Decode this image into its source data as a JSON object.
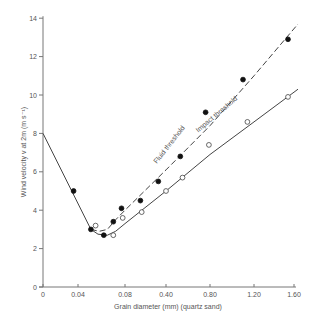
{
  "chart_data": {
    "type": "scatter",
    "title": "",
    "xlabel": "Grain diameter (mm) (quartz sand)",
    "ylabel": "Wind velocity v at 2m (m s⁻¹)",
    "x_ticks": [
      "0",
      "0.04",
      "0.08",
      "0.40",
      "0.80",
      "1.20",
      "1.60"
    ],
    "x_tick_values": [
      0,
      0.04,
      0.08,
      0.4,
      0.8,
      1.2,
      1.6
    ],
    "y_ticks": [
      "0",
      "2",
      "4",
      "6",
      "8",
      "10",
      "12",
      "14"
    ],
    "y_tick_values": [
      0,
      2,
      4,
      6,
      8,
      10,
      12,
      14
    ],
    "ylim": [
      0,
      14
    ],
    "xlim": [
      0,
      1.6
    ],
    "grid": false,
    "legend": "none (curves labeled inline)",
    "series": [
      {
        "name": "Fluid threshold",
        "marker": "filled-circle",
        "line": "dashed",
        "points": [
          {
            "x": 0.035,
            "y": 5.0
          },
          {
            "x": 0.051,
            "y": 3.0
          },
          {
            "x": 0.062,
            "y": 2.7
          },
          {
            "x": 0.07,
            "y": 3.4
          },
          {
            "x": 0.077,
            "y": 4.1
          },
          {
            "x": 0.2,
            "y": 4.5
          },
          {
            "x": 0.34,
            "y": 5.5
          },
          {
            "x": 0.53,
            "y": 6.8
          },
          {
            "x": 0.76,
            "y": 9.1
          },
          {
            "x": 1.1,
            "y": 10.8
          },
          {
            "x": 1.54,
            "y": 12.9
          }
        ],
        "curve": [
          {
            "x": 0.051,
            "y": 3.0
          },
          {
            "x": 0.058,
            "y": 2.9
          },
          {
            "x": 0.065,
            "y": 3.0
          },
          {
            "x": 0.072,
            "y": 3.5
          },
          {
            "x": 0.08,
            "y": 4.0
          },
          {
            "x": 0.4,
            "y": 6.1
          },
          {
            "x": 0.8,
            "y": 8.4
          },
          {
            "x": 1.2,
            "y": 11.0
          },
          {
            "x": 1.64,
            "y": 13.7
          }
        ]
      },
      {
        "name": "Impact threshold",
        "marker": "open-circle",
        "line": "solid",
        "points": [
          {
            "x": 0.055,
            "y": 3.2
          },
          {
            "x": 0.07,
            "y": 2.7
          },
          {
            "x": 0.078,
            "y": 3.6
          },
          {
            "x": 0.21,
            "y": 3.9
          },
          {
            "x": 0.4,
            "y": 5.0
          },
          {
            "x": 0.55,
            "y": 5.7
          },
          {
            "x": 0.79,
            "y": 7.4
          },
          {
            "x": 1.14,
            "y": 8.6
          },
          {
            "x": 1.54,
            "y": 9.9
          }
        ],
        "curve": [
          {
            "x": 0.051,
            "y": 3.0
          },
          {
            "x": 0.057,
            "y": 2.75
          },
          {
            "x": 0.065,
            "y": 2.7
          },
          {
            "x": 0.072,
            "y": 2.9
          },
          {
            "x": 0.08,
            "y": 3.3
          },
          {
            "x": 0.4,
            "y": 5.0
          },
          {
            "x": 0.8,
            "y": 6.9
          },
          {
            "x": 1.2,
            "y": 8.6
          },
          {
            "x": 1.64,
            "y": 10.3
          }
        ]
      },
      {
        "name": "Common fine-grain branch",
        "marker": "none",
        "line": "solid",
        "curve": [
          {
            "x": 0,
            "y": 8.0
          },
          {
            "x": 0.051,
            "y": 3.0
          }
        ]
      }
    ],
    "annotations": [
      {
        "text": "Fluid threshold",
        "x": 0.48,
        "y": 7.2,
        "rotation": -50
      },
      {
        "text": "Impact threshold",
        "x": 0.95,
        "y": 8.2,
        "rotation": -40
      }
    ]
  },
  "labels": {
    "xlabel": "Grain diameter (mm) (quartz sand)",
    "ylabel": "Wind velocity v at 2m (m s⁻¹)",
    "fluid": "Fluid threshold",
    "impact": "Impact threshold"
  },
  "colors": {
    "axis": "#777777",
    "line": "#444444",
    "text": "#555555",
    "marker_fill": "#111111"
  }
}
